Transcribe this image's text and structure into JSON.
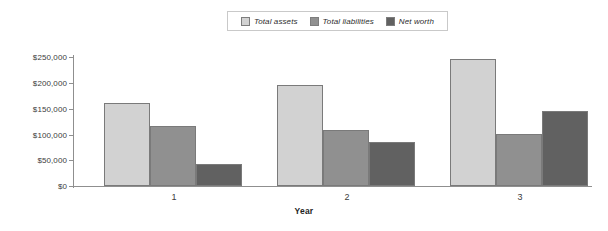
{
  "chart_data": {
    "type": "bar",
    "title": "",
    "subtitle": "",
    "xlabel": "Year",
    "ylabel": "",
    "categories": [
      "1",
      "2",
      "3"
    ],
    "series": [
      {
        "name": "Total assets",
        "color": "#d2d2d2",
        "values": [
          160000,
          195000,
          246000
        ]
      },
      {
        "name": "Total liabilities",
        "color": "#909090",
        "values": [
          116000,
          109000,
          100000
        ]
      },
      {
        "name": "Net worth",
        "color": "#616161",
        "values": [
          43000,
          86000,
          146000
        ]
      }
    ],
    "ylim": [
      0,
      250000
    ],
    "ytick_values": [
      0,
      50000,
      100000,
      150000,
      200000,
      250000
    ],
    "ytick_labels": [
      "$0",
      "$50,000",
      "$100,000",
      "$150,000",
      "$200,000",
      "$250,000"
    ],
    "xtick_labels": [
      "1",
      "2",
      "3"
    ],
    "grid": false,
    "legend_position": "top-center",
    "legend_entries": [
      "Total assets",
      "Total liabilities",
      "Net worth"
    ]
  }
}
